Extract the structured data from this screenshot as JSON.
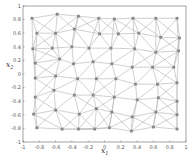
{
  "chart_data": {
    "type": "scatter",
    "subtype": "triangular-mesh",
    "title": "",
    "xlabel": "x1",
    "ylabel": "x2",
    "xlim": [
      -1,
      1
    ],
    "ylim": [
      -1,
      1
    ],
    "x_ticks": [
      "-1",
      "-0.8",
      "-0.6",
      "-0.4",
      "-0.2",
      "0",
      "0.2",
      "0.4",
      "0.6",
      "0.8",
      "1"
    ],
    "y_ticks": [
      "-1",
      "-0.8",
      "-0.6",
      "-0.4",
      "-0.2",
      "0",
      "0.2",
      "0.4",
      "0.6",
      "0.8",
      "1"
    ],
    "grid": false,
    "legend": null,
    "node_color": "#888888",
    "edge_color": "#b0b0b0",
    "nodes": [
      [
        -0.89,
        0.82
      ],
      [
        -0.58,
        0.88
      ],
      [
        -0.32,
        0.85
      ],
      [
        -0.07,
        0.82
      ],
      [
        -0.83,
        0.6
      ],
      [
        -0.6,
        0.6
      ],
      [
        -0.37,
        0.66
      ],
      [
        -0.06,
        0.59
      ],
      [
        -0.88,
        0.37
      ],
      [
        -0.64,
        0.38
      ],
      [
        -0.4,
        0.4
      ],
      [
        -0.19,
        0.38
      ],
      [
        -0.85,
        0.16
      ],
      [
        -0.55,
        0.22
      ],
      [
        -0.38,
        0.15
      ],
      [
        -0.14,
        0.18
      ],
      [
        0.12,
        0.81
      ],
      [
        0.35,
        0.82
      ],
      [
        0.63,
        0.82
      ],
      [
        0.89,
        0.82
      ],
      [
        0.17,
        0.59
      ],
      [
        0.42,
        0.6
      ],
      [
        0.69,
        0.54
      ],
      [
        0.92,
        0.53
      ],
      [
        0.08,
        0.38
      ],
      [
        0.37,
        0.37
      ],
      [
        0.63,
        0.32
      ],
      [
        0.91,
        0.34
      ],
      [
        0.09,
        0.15
      ],
      [
        0.34,
        0.1
      ],
      [
        0.59,
        0.1
      ],
      [
        0.85,
        0.1
      ],
      [
        -0.85,
        -0.06
      ],
      [
        -0.6,
        -0.03
      ],
      [
        -0.33,
        -0.07
      ],
      [
        -0.1,
        -0.07
      ],
      [
        -0.85,
        -0.34
      ],
      [
        -0.62,
        -0.24
      ],
      [
        -0.37,
        -0.31
      ],
      [
        -0.14,
        -0.31
      ],
      [
        -0.87,
        -0.59
      ],
      [
        -0.6,
        -0.53
      ],
      [
        -0.31,
        -0.59
      ],
      [
        -0.1,
        -0.51
      ],
      [
        -0.83,
        -0.79
      ],
      [
        -0.52,
        -0.81
      ],
      [
        -0.32,
        -0.81
      ],
      [
        -0.12,
        -0.81
      ],
      [
        0.14,
        -0.07
      ],
      [
        0.38,
        -0.15
      ],
      [
        0.65,
        -0.15
      ],
      [
        0.89,
        -0.13
      ],
      [
        0.12,
        -0.34
      ],
      [
        0.4,
        -0.38
      ],
      [
        0.66,
        -0.35
      ],
      [
        0.89,
        -0.4
      ],
      [
        0.09,
        -0.56
      ],
      [
        0.34,
        -0.63
      ],
      [
        0.63,
        -0.56
      ],
      [
        0.89,
        -0.6
      ],
      [
        0.06,
        -0.79
      ],
      [
        0.33,
        -0.84
      ],
      [
        0.6,
        -0.78
      ],
      [
        0.89,
        -0.81
      ]
    ]
  }
}
